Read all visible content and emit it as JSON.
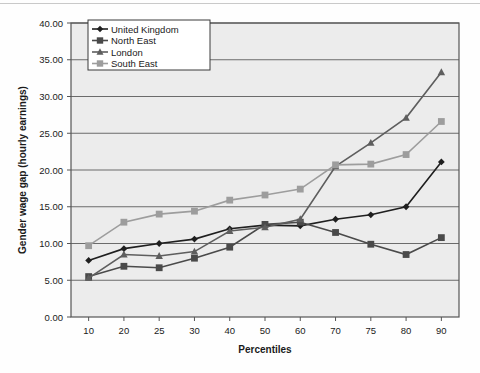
{
  "chart_data": {
    "type": "line",
    "title": "",
    "xlabel": "Percentiles",
    "ylabel": "Gender wage gap (hourly earnings)",
    "categories": [
      "10",
      "20",
      "25",
      "30",
      "40",
      "50",
      "60",
      "70",
      "75",
      "80",
      "90"
    ],
    "x": [
      10,
      20,
      25,
      30,
      40,
      50,
      60,
      70,
      75,
      80,
      90
    ],
    "ylim": [
      0,
      40
    ],
    "yticks": [
      0,
      5,
      10,
      15,
      20,
      25,
      30,
      35,
      40
    ],
    "ytick_labels": [
      "0.00",
      "5.00",
      "10.00",
      "15.00",
      "20.00",
      "25.00",
      "30.00",
      "35.00",
      "40.00"
    ],
    "grid": true,
    "grid_axis": "y",
    "legend_position": "top-left-inside",
    "series": [
      {
        "name": "United Kingdom",
        "marker": "diamond",
        "color": "#1f1f1f",
        "values": [
          7.7,
          9.3,
          10.0,
          10.6,
          12.0,
          12.5,
          12.4,
          13.3,
          13.9,
          15.0,
          21.1
        ]
      },
      {
        "name": "North East",
        "marker": "square",
        "color": "#4a4a4a",
        "values": [
          5.5,
          6.9,
          6.7,
          8.0,
          9.5,
          12.6,
          12.9,
          11.5,
          9.9,
          8.5,
          10.8
        ]
      },
      {
        "name": "London",
        "marker": "triangle",
        "color": "#5e5e5e",
        "values": [
          5.3,
          8.5,
          8.3,
          8.9,
          11.7,
          12.2,
          13.3,
          20.5,
          23.7,
          27.1,
          33.3
        ]
      },
      {
        "name": "South East",
        "marker": "square",
        "color": "#9d9d9d",
        "values": [
          9.7,
          12.9,
          14.0,
          14.4,
          15.9,
          16.6,
          17.4,
          20.7,
          20.8,
          22.1,
          26.6
        ]
      }
    ]
  },
  "legend": {
    "entries": [
      {
        "label": "United Kingdom"
      },
      {
        "label": "North East"
      },
      {
        "label": "London"
      },
      {
        "label": "South East"
      }
    ]
  },
  "colors": {
    "plot_background": "#ececec",
    "frame": "#555555",
    "gridline": "#6b6b6b",
    "page_background": "#ffffff",
    "top_rule": "#c9c9c9"
  }
}
